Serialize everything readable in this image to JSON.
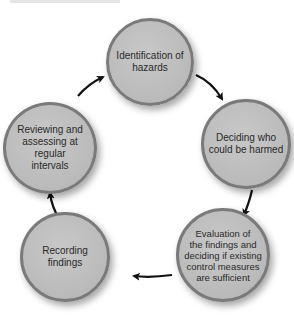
{
  "diagram": {
    "type": "cycle",
    "direction": "clockwise",
    "colors": {
      "node_fill": "#bcbcbc",
      "node_border": "#7a7a7a",
      "arrow": "#111111",
      "text": "#2a2a2a"
    },
    "nodes": [
      {
        "id": "n1",
        "label": "Identification of hazards",
        "lines": [
          "Identification of",
          "hazards"
        ]
      },
      {
        "id": "n2",
        "label": "Deciding who could be harmed",
        "lines": [
          "Deciding who",
          "could be harmed"
        ]
      },
      {
        "id": "n3",
        "label": "Evaluation of the findings and deciding if existing control measures are sufficient",
        "lines": [
          "Evaluation of",
          "the findings and",
          "deciding if existing",
          "control measures",
          "are sufficient"
        ]
      },
      {
        "id": "n4",
        "label": "Recording findings",
        "lines": [
          "Recording findings"
        ]
      },
      {
        "id": "n5",
        "label": "Reviewing and assessing at regular intervals",
        "lines": [
          "Reviewing and",
          "assessing at regular",
          "intervals"
        ]
      }
    ],
    "edges": [
      {
        "from": "n1",
        "to": "n2"
      },
      {
        "from": "n2",
        "to": "n3"
      },
      {
        "from": "n3",
        "to": "n4"
      },
      {
        "from": "n4",
        "to": "n5"
      },
      {
        "from": "n5",
        "to": "n1"
      }
    ]
  }
}
